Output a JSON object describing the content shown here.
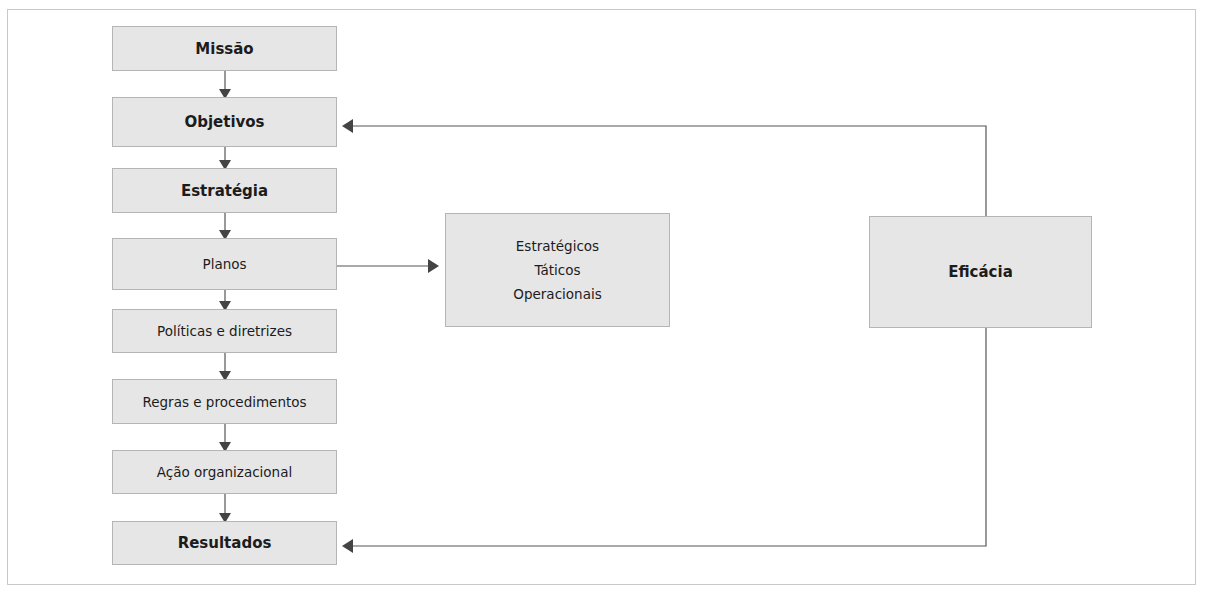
{
  "diagram": {
    "flow_boxes": [
      {
        "label": "Missão",
        "weight": "bold"
      },
      {
        "label": "Objetivos",
        "weight": "bold"
      },
      {
        "label": "Estratégia",
        "weight": "bold"
      },
      {
        "label": "Planos",
        "weight": "normal"
      },
      {
        "label": "Políticas e diretrizes",
        "weight": "normal"
      },
      {
        "label": "Regras e procedimentos",
        "weight": "normal"
      },
      {
        "label": "Ação organizacional",
        "weight": "normal"
      },
      {
        "label": "Resultados",
        "weight": "bold"
      }
    ],
    "plan_types": {
      "items": [
        "Estratégicos",
        "Táticos",
        "Operacionais"
      ]
    },
    "feedback": {
      "label": "Eficácia"
    },
    "colors": {
      "box_fill": "#e6e6e6",
      "box_border": "#b5b5b5",
      "arrow": "#444444",
      "line": "#555555",
      "frame": "#c9c9c9"
    }
  }
}
